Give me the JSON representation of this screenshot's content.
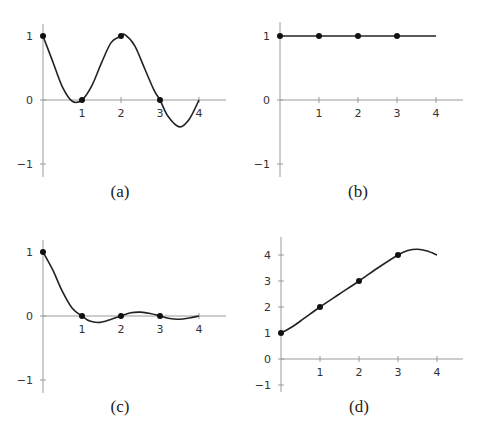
{
  "chart_data": [
    {
      "panel": "a",
      "caption": "(a)",
      "type": "line",
      "x_ticks": [
        "1",
        "2",
        "3",
        "4"
      ],
      "y_ticks": [
        "1",
        "0",
        "−1"
      ],
      "xlim": [
        0,
        4.7
      ],
      "ylim": [
        -1.2,
        1.2
      ],
      "points": [
        [
          0,
          1
        ],
        [
          1,
          0
        ],
        [
          2,
          1
        ],
        [
          3,
          0
        ]
      ],
      "curve": [
        [
          0,
          1
        ],
        [
          0.25,
          0.6
        ],
        [
          0.5,
          0.2
        ],
        [
          0.75,
          -0.02
        ],
        [
          1,
          0
        ],
        [
          1.25,
          0.22
        ],
        [
          1.5,
          0.58
        ],
        [
          1.75,
          0.9
        ],
        [
          2,
          1
        ],
        [
          2.1,
          1.02
        ],
        [
          2.35,
          0.85
        ],
        [
          2.6,
          0.5
        ],
        [
          2.85,
          0.15
        ],
        [
          3,
          0
        ],
        [
          3.2,
          -0.25
        ],
        [
          3.5,
          -0.42
        ],
        [
          3.75,
          -0.3
        ],
        [
          4,
          0
        ]
      ],
      "grid": false
    },
    {
      "panel": "b",
      "caption": "(b)",
      "type": "line",
      "x_ticks": [
        "1",
        "2",
        "3",
        "4"
      ],
      "y_ticks": [
        "1",
        "0",
        "−1"
      ],
      "xlim": [
        0,
        4.7
      ],
      "ylim": [
        -1.2,
        1.2
      ],
      "points": [
        [
          0,
          1
        ],
        [
          1,
          1
        ],
        [
          2,
          1
        ],
        [
          3,
          1
        ]
      ],
      "curve": [
        [
          0,
          1
        ],
        [
          4,
          1
        ]
      ],
      "grid": false
    },
    {
      "panel": "c",
      "caption": "(c)",
      "type": "line",
      "x_ticks": [
        "1",
        "2",
        "3",
        "4"
      ],
      "y_ticks": [
        "1",
        "0",
        "−1"
      ],
      "xlim": [
        0,
        4.7
      ],
      "ylim": [
        -1.2,
        1.2
      ],
      "points": [
        [
          0,
          1
        ],
        [
          1,
          0
        ],
        [
          2,
          0
        ],
        [
          3,
          0
        ]
      ],
      "curve": [
        [
          0,
          1
        ],
        [
          0.25,
          0.72
        ],
        [
          0.5,
          0.38
        ],
        [
          0.75,
          0.12
        ],
        [
          1,
          0
        ],
        [
          1.2,
          -0.08
        ],
        [
          1.45,
          -0.1
        ],
        [
          1.75,
          -0.05
        ],
        [
          2,
          0
        ],
        [
          2.25,
          0.05
        ],
        [
          2.5,
          0.06
        ],
        [
          2.75,
          0.04
        ],
        [
          3,
          0
        ],
        [
          3.25,
          -0.04
        ],
        [
          3.5,
          -0.05
        ],
        [
          3.75,
          -0.03
        ],
        [
          4,
          0
        ]
      ],
      "grid": false
    },
    {
      "panel": "d",
      "caption": "(d)",
      "type": "line",
      "x_ticks": [
        "1",
        "2",
        "3",
        "4"
      ],
      "y_ticks": [
        "4",
        "3",
        "2",
        "1",
        "0",
        "−1"
      ],
      "xlim": [
        0,
        4.7
      ],
      "ylim": [
        -1.2,
        4.7
      ],
      "points": [
        [
          0,
          1
        ],
        [
          1,
          2
        ],
        [
          2,
          3
        ],
        [
          3,
          4
        ]
      ],
      "curve": [
        [
          0,
          1
        ],
        [
          0.3,
          1.25
        ],
        [
          0.6,
          1.57
        ],
        [
          1,
          2
        ],
        [
          1.5,
          2.5
        ],
        [
          2,
          3
        ],
        [
          2.5,
          3.52
        ],
        [
          3,
          4
        ],
        [
          3.25,
          4.17
        ],
        [
          3.5,
          4.22
        ],
        [
          3.75,
          4.15
        ],
        [
          4,
          4.0
        ]
      ],
      "grid": false
    }
  ]
}
